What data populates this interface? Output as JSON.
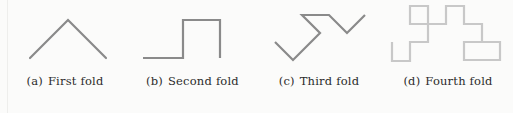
{
  "figure": {
    "background_color": "#fbfbfa",
    "stroke_colors": {
      "dark_gray": "#8a8a8a",
      "light_gray": "#c8c8c8"
    },
    "caption_color": "#2b2b2b"
  },
  "panels": [
    {
      "id": "a",
      "tag": "(a)",
      "label": "First fold",
      "icon_name": "first-fold-path-icon",
      "stroke_color": "#8a8a8a",
      "stroke_width": 2.2,
      "viewbox": "0 0 130 72",
      "points": "30,58 68,20 106,58"
    },
    {
      "id": "b",
      "tag": "(b)",
      "label": "Second fold",
      "icon_name": "second-fold-path-icon",
      "stroke_color": "#8a8a8a",
      "stroke_width": 2.2,
      "viewbox": "0 0 125 72",
      "points": "13,58 53,58 53,20 90,20 90,58"
    },
    {
      "id": "c",
      "tag": "(c)",
      "label": "Third fold",
      "icon_name": "third-fold-path-icon",
      "stroke_color": "#8a8a8a",
      "stroke_width": 2.2,
      "viewbox": "0 0 128 72",
      "points": "20,42 38,60 65,33 47,15 74,15 92,33 110,15"
    },
    {
      "id": "d",
      "tag": "(d)",
      "label": "Fourth fold",
      "icon_name": "fourth-fold-path-icon",
      "stroke_color": "#c8c8c8",
      "stroke_width": 2.2,
      "viewbox": "0 0 130 72",
      "points": "9,42 9,61 27,61 27,42 45,42 45,24 27,24 27,6 45,6 45,24 63,24 63,6 81,6 81,24 99,24 99,42 81,42 81,60 117,60 117,42 99,42"
    }
  ]
}
